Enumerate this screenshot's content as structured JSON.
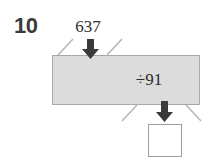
{
  "item": {
    "number": "10",
    "type": "function-machine"
  },
  "machine": {
    "input_label": "637",
    "operation_label": "÷91",
    "output_label": "",
    "output_placeholder": ""
  },
  "icons": {
    "input_arrow": "arrow-down-icon",
    "output_arrow": "arrow-down-icon",
    "spark_top_left": "spark-line-icon",
    "spark_top_right": "spark-line-icon",
    "spark_bottom_left": "spark-line-icon",
    "spark_bottom_right": "spark-line-icon"
  },
  "colors": {
    "machine_fill": "#dcdcdc",
    "machine_border": "#a9a9a9",
    "arrow": "#3a3a3a",
    "spark": "#b4b4b4",
    "answer_border": "#9d9d9d",
    "text": "#2e2e2e",
    "number_text": "#3b3b3b",
    "background": "#ffffff"
  }
}
